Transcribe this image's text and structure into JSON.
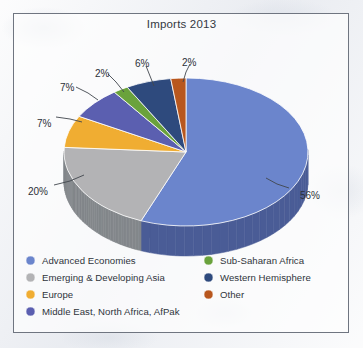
{
  "figure": {
    "background_color": "#eceef2",
    "frame_border_color": "#6f7580"
  },
  "chart_data": {
    "type": "pie",
    "title": "Imports 2013",
    "subtitle": "",
    "xlabel": "",
    "ylabel": "",
    "units": "percent",
    "start_angle_deg": 0,
    "direction": "clockwise",
    "three_d": true,
    "legend_position": "bottom",
    "grid": false,
    "categories": [
      "Advanced Economies",
      "Emerging & Developing Asia",
      "Europe",
      "Middle East, North Africa, AfPak",
      "Sub-Saharan Africa",
      "Western Hemisphere",
      "Other"
    ],
    "values": [
      56,
      20,
      7,
      7,
      2,
      6,
      2
    ],
    "data_labels": [
      "56%",
      "20%",
      "7%",
      "7%",
      "2%",
      "6%",
      "2%"
    ],
    "colors": [
      "#6b85cc",
      "#b3b3b5",
      "#f0ad32",
      "#5b5fb0",
      "#6aa23c",
      "#2e4a7d",
      "#b8571e"
    ],
    "side_colors": [
      "#4a5c96",
      "#83878b",
      "#b8841f",
      "#434781",
      "#4d7529",
      "#21355a",
      "#8a4016"
    ]
  },
  "legend": {
    "left_column": [
      {
        "label": "Advanced Economies",
        "color": "#6b85cc"
      },
      {
        "label": "Emerging & Developing Asia",
        "color": "#b3b3b5"
      },
      {
        "label": "Europe",
        "color": "#f0ad32"
      },
      {
        "label": "Middle East, North Africa, AfPak",
        "color": "#5b5fb0"
      }
    ],
    "right_column": [
      {
        "label": "Sub-Saharan Africa",
        "color": "#6aa23c"
      },
      {
        "label": "Western Hemisphere",
        "color": "#2e4a7d"
      },
      {
        "label": "Other",
        "color": "#b8571e"
      }
    ]
  },
  "callouts": [
    {
      "text": "56%",
      "x": 300,
      "y": 190
    },
    {
      "text": "20%",
      "x": 28,
      "y": 186
    },
    {
      "text": "7%",
      "x": 37,
      "y": 118
    },
    {
      "text": "7%",
      "x": 60,
      "y": 82
    },
    {
      "text": "2%",
      "x": 95,
      "y": 68
    },
    {
      "text": "6%",
      "x": 135,
      "y": 58
    },
    {
      "text": "2%",
      "x": 182,
      "y": 57
    }
  ]
}
